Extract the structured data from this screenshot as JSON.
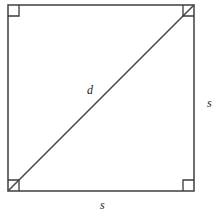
{
  "figure": {
    "type": "geometry-diagram",
    "canvas": {
      "width": 224,
      "height": 224,
      "background": "#ffffff"
    },
    "stroke": {
      "color": "#4a4a4a",
      "width": 1.6
    },
    "marker_stroke": {
      "color": "#3a3a3a",
      "width": 1.3
    },
    "square": {
      "name": "square-shape",
      "x": 8,
      "y": 5,
      "side": 186,
      "vertices": [
        {
          "name": "top-left",
          "x": 8,
          "y": 5
        },
        {
          "name": "top-right",
          "x": 194,
          "y": 5
        },
        {
          "name": "bottom-right",
          "x": 194,
          "y": 191
        },
        {
          "name": "bottom-left",
          "x": 8,
          "y": 191
        }
      ]
    },
    "diagonal": {
      "name": "diagonal-line",
      "from": {
        "x": 8,
        "y": 191
      },
      "to": {
        "x": 194,
        "y": 5
      }
    },
    "right_angle_markers": [
      {
        "name": "right-angle-marker-top-left",
        "corner": "top-left",
        "size": 11
      },
      {
        "name": "right-angle-marker-top-right",
        "corner": "top-right",
        "size": 11
      },
      {
        "name": "right-angle-marker-bottom-right",
        "corner": "bottom-right",
        "size": 11
      },
      {
        "name": "right-angle-marker-bottom-left",
        "corner": "bottom-left",
        "size": 11
      }
    ],
    "labels": {
      "diagonal": "d",
      "side_right": "s",
      "side_bottom": "s"
    }
  }
}
